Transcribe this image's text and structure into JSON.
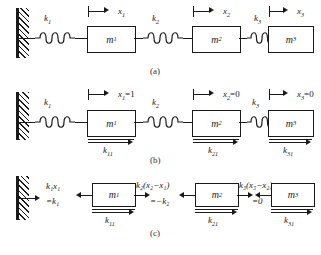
{
  "figure": {
    "panels": [
      {
        "id": "a",
        "caption": "(a)",
        "description": "General spring-mass chain with displacements x1, x2, x3",
        "masses": [
          {
            "label": "m",
            "sub": "1"
          },
          {
            "label": "m",
            "sub": "2"
          },
          {
            "label": "m",
            "sub": "3"
          }
        ],
        "springs": [
          {
            "label": "k",
            "sub": "1"
          },
          {
            "label": "k",
            "sub": "2"
          },
          {
            "label": "k",
            "sub": "3"
          }
        ],
        "displacements": [
          {
            "label": "x",
            "sub": "1",
            "value": ""
          },
          {
            "label": "x",
            "sub": "2",
            "value": ""
          },
          {
            "label": "x",
            "sub": "3",
            "value": ""
          }
        ]
      },
      {
        "id": "b",
        "caption": "(b)",
        "description": "Unit displacement of mass 1: x1=1, x2=0, x3=0",
        "masses": [
          {
            "label": "m",
            "sub": "1"
          },
          {
            "label": "m",
            "sub": "2"
          },
          {
            "label": "m",
            "sub": "3"
          }
        ],
        "springs": [
          {
            "label": "k",
            "sub": "1"
          },
          {
            "label": "k",
            "sub": "2"
          },
          {
            "label": "k",
            "sub": "3"
          }
        ],
        "displacements": [
          {
            "label": "x",
            "sub": "1",
            "value": "=1"
          },
          {
            "label": "x",
            "sub": "2",
            "value": "=0"
          },
          {
            "label": "x",
            "sub": "3",
            "value": "=0"
          }
        ],
        "reactions": [
          {
            "label": "k",
            "sub": "11"
          },
          {
            "label": "k",
            "sub": "21"
          },
          {
            "label": "k",
            "sub": "31"
          }
        ]
      },
      {
        "id": "c",
        "caption": "(c)",
        "description": "Free-body diagram with spring forces evaluated for the unit displacement case",
        "masses": [
          {
            "label": "m",
            "sub": "1"
          },
          {
            "label": "m",
            "sub": "2"
          },
          {
            "label": "m",
            "sub": "3"
          }
        ],
        "forces": [
          {
            "expr": "k",
            "expr_sub": "1",
            "expr_tail": "x",
            "expr_tail_sub": "1",
            "result": "=k",
            "result_sub": "1"
          },
          {
            "expr": "k",
            "expr_sub": "2",
            "expr_tail": "(x",
            "expr_tail_sub": "2",
            "result": "=−k",
            "result_sub": "2"
          },
          {
            "expr": "k",
            "expr_sub": "3",
            "expr_tail": "(x",
            "expr_tail_sub": "3",
            "result": "=0",
            "result_sub": ""
          }
        ],
        "force_labels": [
          {
            "text_main": "k",
            "text_sub": "1",
            "text_rest": "x",
            "text_rest_sub": "1",
            "second_line": "=k",
            "second_sub": "1"
          },
          {
            "text_main": "k",
            "text_sub": "2",
            "text_rest": "(x",
            "text_rest_sub": "2",
            "second_line": "=−k",
            "second_sub": "2"
          },
          {
            "text_main": "k",
            "text_sub": "3",
            "text_rest": "(x",
            "text_rest_sub": "3",
            "second_line": "=0",
            "second_sub": ""
          }
        ],
        "reactions": [
          {
            "label": "k",
            "sub": "11"
          },
          {
            "label": "k",
            "sub": "21"
          },
          {
            "label": "k",
            "sub": "31"
          }
        ]
      }
    ],
    "text": {
      "cap_a": "(a)",
      "cap_b": "(b)",
      "cap_c": "(c)",
      "a_k1": "k",
      "a_k1_sub": "1",
      "a_k2": "k",
      "a_k2_sub": "2",
      "a_k3": "k",
      "a_k3_sub": "3",
      "a_m1": "m",
      "a_m1_sub": "1",
      "a_m2": "m",
      "a_m2_sub": "2",
      "a_m3": "m",
      "a_m3_sub": "3",
      "a_x1": "x",
      "a_x1_sub": "1",
      "a_x1_val": "",
      "a_x2": "x",
      "a_x2_sub": "2",
      "a_x2_val": "",
      "a_x3": "x",
      "a_x3_sub": "3",
      "a_x3_val": "",
      "b_k1": "k",
      "b_k1_sub": "1",
      "b_k2": "k",
      "b_k2_sub": "2",
      "b_k3": "k",
      "b_k3_sub": "3",
      "b_m1": "m",
      "b_m1_sub": "1",
      "b_m2": "m",
      "b_m2_sub": "2",
      "b_m3": "m",
      "b_m3_sub": "3",
      "b_x1": "x",
      "b_x1_sub": "1",
      "b_x1_val": "=1",
      "b_x2": "x",
      "b_x2_sub": "2",
      "b_x2_val": "=0",
      "b_x3": "x",
      "b_x3_sub": "3",
      "b_x3_val": "=0",
      "b_k11": "k",
      "b_k11_sub": "11",
      "b_k21": "k",
      "b_k21_sub": "21",
      "b_k31": "k",
      "b_k31_sub": "31",
      "c_m1": "m",
      "c_m1_sub": "1",
      "c_m2": "m",
      "c_m2_sub": "2",
      "c_m3": "m",
      "c_m3_sub": "3",
      "c_f1_line1": "k₁x₁",
      "c_f1_line2": "=k₁",
      "c_f2_line1": "k₂(x₂−x₁)",
      "c_f2_line2": "=−k₂",
      "c_f3_line1": "k₃(x₃−x₂)",
      "c_f3_line2": "=0",
      "c_k11": "k",
      "c_k11_sub": "11",
      "c_k21": "k",
      "c_k21_sub": "21",
      "c_k31": "k",
      "c_k31_sub": "31"
    },
    "colors": {
      "ink": "#1a1a1a",
      "paper": "#ffffff"
    }
  }
}
